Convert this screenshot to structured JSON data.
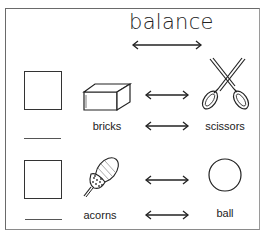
{
  "title": "balance",
  "rows": [
    {
      "left_item": "bricks",
      "right_item": "scissors",
      "answer_box": "",
      "answer_line": ""
    },
    {
      "left_item": "acorns",
      "right_item": "ball",
      "answer_box": "",
      "answer_line": ""
    }
  ],
  "icons": {
    "balance_arrow": "double-arrow-icon",
    "row_arrow": "double-arrow-icon",
    "brick": "brick-icon",
    "scissors": "scissors-icon",
    "acorn": "acorn-icon",
    "ball": "circle-icon"
  },
  "colors": {
    "ink": "#222222",
    "frame": "#6a6a6a",
    "background": "#ffffff"
  }
}
